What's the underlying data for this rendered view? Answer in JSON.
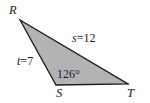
{
  "figure": {
    "type": "triangle-diagram",
    "background_color": "#ffffff",
    "fill_color": "#b3b3b3",
    "stroke_color": "#1a1a1a",
    "vertices": {
      "R": {
        "label": "R",
        "x": 20,
        "y": 20
      },
      "S": {
        "label": "S",
        "x": 56,
        "y": 85
      },
      "T": {
        "label": "T",
        "x": 128,
        "y": 84
      }
    },
    "side_labels": {
      "s": {
        "var": "s",
        "eq": "=",
        "value": "12",
        "full": "s =12"
      },
      "t": {
        "var": "t",
        "eq": "=",
        "value": "7",
        "full": "t =7"
      }
    },
    "angle_labels": {
      "S": {
        "text": "126°",
        "value": "126",
        "unit": "°"
      }
    }
  }
}
